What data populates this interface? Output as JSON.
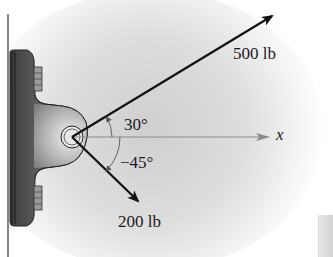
{
  "diagram": {
    "type": "force-vector-diagram",
    "forces": [
      {
        "id": "F1",
        "label": "500 lb",
        "magnitude": 500,
        "unit": "lb",
        "angle_deg": 30
      },
      {
        "id": "F2",
        "label": "200 lb",
        "magnitude": 200,
        "unit": "lb",
        "angle_deg": -45
      }
    ],
    "angles": [
      {
        "label": "30°",
        "from": "x-axis",
        "to": "F1"
      },
      {
        "label": "−45°",
        "from": "x-axis",
        "to": "F2"
      }
    ],
    "axis": {
      "label": "x"
    },
    "colors": {
      "line": "#111111",
      "axis": "#8a8a8a",
      "bracket_dark": "#4a4a4a",
      "bracket_light": "#bdbdbd",
      "background_glow": "#d9d9d9"
    }
  }
}
